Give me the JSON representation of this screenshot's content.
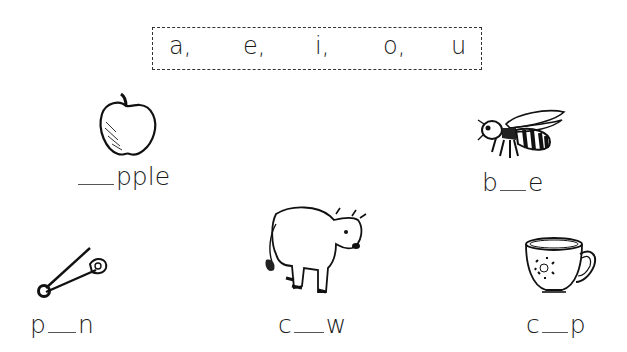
{
  "vowels": [
    "a,",
    "e,",
    "i,",
    "o,",
    "u"
  ],
  "items": [
    {
      "picture": "apple",
      "before": "",
      "after": "pple"
    },
    {
      "picture": "bee",
      "before": "b",
      "after": "e"
    },
    {
      "picture": "pin",
      "before": "p",
      "after": "n"
    },
    {
      "picture": "cow",
      "before": "c",
      "after": "w"
    },
    {
      "picture": "cup",
      "before": "c",
      "after": "p"
    }
  ]
}
